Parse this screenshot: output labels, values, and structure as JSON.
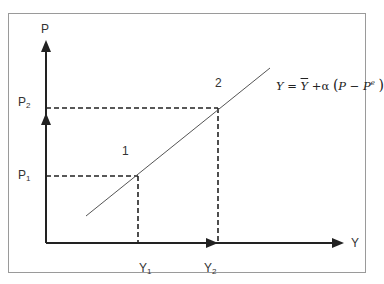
{
  "diagram": {
    "type": "economics-supply-curve",
    "axes": {
      "vertical_label": "P",
      "horizontal_label": "Y"
    },
    "price_levels": [
      {
        "label": "P",
        "subscript": "1"
      },
      {
        "label": "P",
        "subscript": "2"
      }
    ],
    "output_levels": [
      {
        "label": "Y",
        "subscript": "1"
      },
      {
        "label": "Y",
        "subscript": "2"
      }
    ],
    "points": [
      {
        "label": "1"
      },
      {
        "label": "2"
      }
    ],
    "equation": {
      "lhs": "Y",
      "equals": "=",
      "ybar": "Y",
      "plus": "+",
      "alpha": "α",
      "open": "(",
      "p": "P",
      "minus": "−",
      "pe": "P",
      "pe_sup": "e",
      "close": ")"
    },
    "colors": {
      "axis": "#222222",
      "curve": "#555555",
      "dashed": "#222222",
      "frame": "#9a9a9a"
    }
  }
}
